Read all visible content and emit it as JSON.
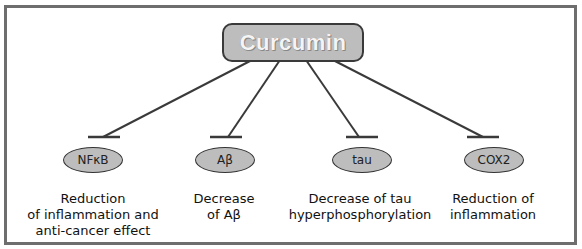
{
  "diagram": {
    "root": {
      "label": "Curcumin"
    },
    "targets": [
      {
        "name": "NFκB",
        "effect_lines": [
          "Reduction",
          "of inflammation and",
          "anti-cancer effect"
        ],
        "relation": "inhibits"
      },
      {
        "name": "Aβ",
        "effect_lines": [
          "Decrease",
          "of Aβ"
        ],
        "relation": "inhibits"
      },
      {
        "name": "tau",
        "effect_lines": [
          "Decrease of tau",
          "hyperphosphorylation"
        ],
        "relation": "inhibits"
      },
      {
        "name": "COX2",
        "effect_lines": [
          "Reduction of",
          "inflammation"
        ],
        "relation": "inhibits"
      }
    ],
    "colors": {
      "node_fill": "#bdbdbd",
      "border": "#333333",
      "frame": "#6e6e6e",
      "root_text": "#f4f4f4"
    }
  }
}
